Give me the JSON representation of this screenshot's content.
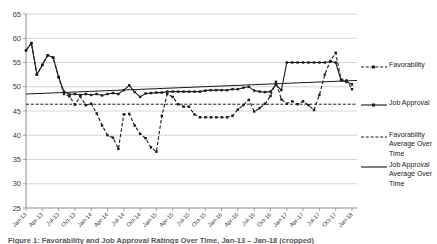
{
  "colors": {
    "line": "#1a1a1a",
    "grid": "#c9c9c9",
    "axis": "#8c8c8c",
    "text": "#404040",
    "background": "#ffffff"
  },
  "chart_data": {
    "type": "line",
    "title": "",
    "xlabel": "",
    "ylabel": "",
    "ylim": [
      25,
      65
    ],
    "ytick_step": 5,
    "grid": true,
    "legend_position": "right",
    "x_months": [
      "Jan-13",
      "Feb-13",
      "Mar-13",
      "Apr-13",
      "May-13",
      "Jun-13",
      "Jul-13",
      "Aug-13",
      "Sep-13",
      "Oct-13",
      "Nov-13",
      "Dec-13",
      "Jan-14",
      "Feb-14",
      "Mar-14",
      "Apr-14",
      "May-14",
      "Jun-14",
      "Jul-14",
      "Aug-14",
      "Sep-14",
      "Oct-14",
      "Nov-14",
      "Dec-14",
      "Jan-15",
      "Feb-15",
      "Mar-15",
      "Apr-15",
      "May-15",
      "Jun-15",
      "Jul-15",
      "Aug-15",
      "Sep-15",
      "Oct-15",
      "Nov-15",
      "Dec-15",
      "Jan-16",
      "Feb-16",
      "Mar-16",
      "Apr-16",
      "May-16",
      "Jun-16",
      "Jul-16",
      "Aug-16",
      "Sep-16",
      "Oct-16",
      "Nov-16",
      "Dec-16",
      "Jan-17",
      "Feb-17",
      "Mar-17",
      "Apr-17",
      "May-17",
      "Jun-17",
      "Jul-17",
      "Aug-17",
      "Sep-17",
      "Oct-17",
      "Nov-17",
      "Dec-17",
      "Jan-18"
    ],
    "x_tick_labels": [
      "Jan-13",
      "Apr-13",
      "Jul-13",
      "Oct-13",
      "Jan-14",
      "Apr-14",
      "Jul-14",
      "Oct-14",
      "Jan-15",
      "Apr-15",
      "Jul-15",
      "Oct-15",
      "Jan-16",
      "Apr-16",
      "Jul-16",
      "Oct-16",
      "Jan-17",
      "Apr-17",
      "Jul-17",
      "Oct-17",
      "Jan-18"
    ],
    "x_tick_interval": 3,
    "series": [
      {
        "name": "Favorability",
        "style": "dashed-markers",
        "values": [
          57.5,
          59,
          52.5,
          54.5,
          56.5,
          56,
          52,
          48.5,
          48,
          46.3,
          48,
          46.2,
          46.5,
          44.5,
          42,
          40,
          39.5,
          37.2,
          44.3,
          44.4,
          42,
          40.3,
          39.4,
          37.5,
          36.6,
          44,
          48.5,
          47.9,
          46.4,
          45.9,
          45.9,
          44.3,
          43.7,
          43.7,
          43.7,
          43.7,
          43.7,
          43.7,
          44,
          45.3,
          46.2,
          47.3,
          44.9,
          45.6,
          46.5,
          48.1,
          51,
          47.4,
          46.5,
          47,
          46.4,
          47,
          46.2,
          45.2,
          48.3,
          52.5,
          55.3,
          57,
          51.5,
          51.3,
          49.5
        ]
      },
      {
        "name": "Job Approval",
        "style": "solid-markers",
        "values": [
          57.5,
          59,
          52.5,
          54.5,
          56.5,
          56,
          52,
          49,
          48.4,
          48.5,
          48.3,
          48.5,
          48.3,
          48.5,
          48.2,
          48.5,
          48.7,
          48.5,
          49.3,
          50.3,
          48.9,
          47.9,
          48.6,
          48.7,
          48.8,
          48.8,
          49,
          49,
          49,
          49,
          49,
          49,
          49,
          49.2,
          49.3,
          49.3,
          49.3,
          49.3,
          49.5,
          49.5,
          49.8,
          50,
          49.2,
          49,
          48.9,
          49,
          50.4,
          49.3,
          55,
          55,
          55,
          55,
          55,
          55,
          55,
          55,
          55.2,
          55,
          51.3,
          51,
          50.5
        ]
      },
      {
        "name": "Favorability Average Over Time",
        "style": "dashed",
        "trend": [
          46.4,
          46.4
        ]
      },
      {
        "name": "Job Approval Average Over Time",
        "style": "solid",
        "trend": [
          48.5,
          51.3
        ]
      }
    ]
  },
  "legend": {
    "items": [
      {
        "label": "Favorability"
      },
      {
        "label": "Job Approval"
      },
      {
        "label": "Favorability Average Over Time"
      },
      {
        "label": "Job Approval Average Over Time"
      }
    ]
  },
  "caption": {
    "text": "Figure 1: Favorability and Job Approval Ratings Over Time, Jan-13 – Jan-18 (cropped)"
  }
}
